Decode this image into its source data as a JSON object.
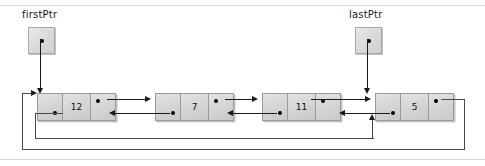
{
  "figure": {
    "type": "circular-doubly-linked-list",
    "title": "",
    "pointers": [
      {
        "name": "firstPtr",
        "label": "firstPtr",
        "x": 28,
        "y": 27,
        "target_node": 0,
        "target_cell": "node-start"
      },
      {
        "name": "lastPtr",
        "label": "lastPtr",
        "x": 355,
        "y": 27,
        "target_node": 3,
        "target_cell": "node-start"
      }
    ],
    "nodes": [
      {
        "index": 0,
        "value": "12",
        "x": 37,
        "prev_label": "",
        "next_label": ""
      },
      {
        "index": 1,
        "value": "7",
        "x": 155,
        "prev_label": "",
        "next_label": ""
      },
      {
        "index": 2,
        "value": "11",
        "x": 262,
        "prev_label": "",
        "next_label": ""
      },
      {
        "index": 3,
        "value": "5",
        "x": 375,
        "prev_label": "",
        "next_label": ""
      }
    ],
    "links": [
      {
        "from": 0,
        "to": 1,
        "direction": "next"
      },
      {
        "from": 1,
        "to": 0,
        "direction": "prev"
      },
      {
        "from": 1,
        "to": 2,
        "direction": "next"
      },
      {
        "from": 2,
        "to": 1,
        "direction": "prev"
      },
      {
        "from": 2,
        "to": 3,
        "direction": "next"
      },
      {
        "from": 3,
        "to": 2,
        "direction": "prev"
      },
      {
        "from": 3,
        "to": 0,
        "direction": "next-wrap"
      },
      {
        "from": 0,
        "to": 3,
        "direction": "prev-wrap"
      }
    ],
    "colors": {
      "node_fill": "#d8d8d8",
      "node_border": "#9a9a9a",
      "wire": "#1a1a1a",
      "loop_wire": "#4a4a4a",
      "rule": "#d8d8d8",
      "text": "#1a1a1a",
      "background": "#ffffff"
    }
  }
}
